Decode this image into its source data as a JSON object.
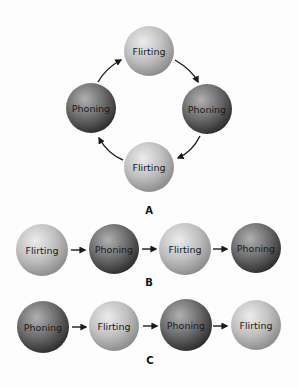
{
  "colors": {
    "background": "#fdfdfd",
    "flirting_light": "#e6e6e6",
    "flirting_mid": "#c2c2c2",
    "flirting_dark": "#8e8e8e",
    "phoning_light": "#a8a8a8",
    "phoning_mid": "#6e6e6e",
    "phoning_dark": "#333333",
    "arrow": "#1a1a1a"
  },
  "panels": {
    "A": {
      "label": "A",
      "type": "cycle",
      "nodes": [
        {
          "label": "Flirting",
          "kind": "flirting"
        },
        {
          "label": "Phoning",
          "kind": "phoning"
        },
        {
          "label": "Flirting",
          "kind": "flirting"
        },
        {
          "label": "Phoning",
          "kind": "phoning"
        }
      ],
      "arrows": [
        "top→right",
        "right→bottom",
        "bottom→left",
        "left→top"
      ]
    },
    "B": {
      "label": "B",
      "type": "sequence",
      "nodes": [
        {
          "label": "Flirting",
          "kind": "flirting"
        },
        {
          "label": "Phoning",
          "kind": "phoning"
        },
        {
          "label": "Flirting",
          "kind": "flirting"
        },
        {
          "label": "Phoning",
          "kind": "phoning"
        }
      ]
    },
    "C": {
      "label": "C",
      "type": "sequence",
      "nodes": [
        {
          "label": "Phoning",
          "kind": "phoning"
        },
        {
          "label": "Flirting",
          "kind": "flirting"
        },
        {
          "label": "Phoning",
          "kind": "phoning"
        },
        {
          "label": "Flirting",
          "kind": "flirting"
        }
      ]
    }
  }
}
